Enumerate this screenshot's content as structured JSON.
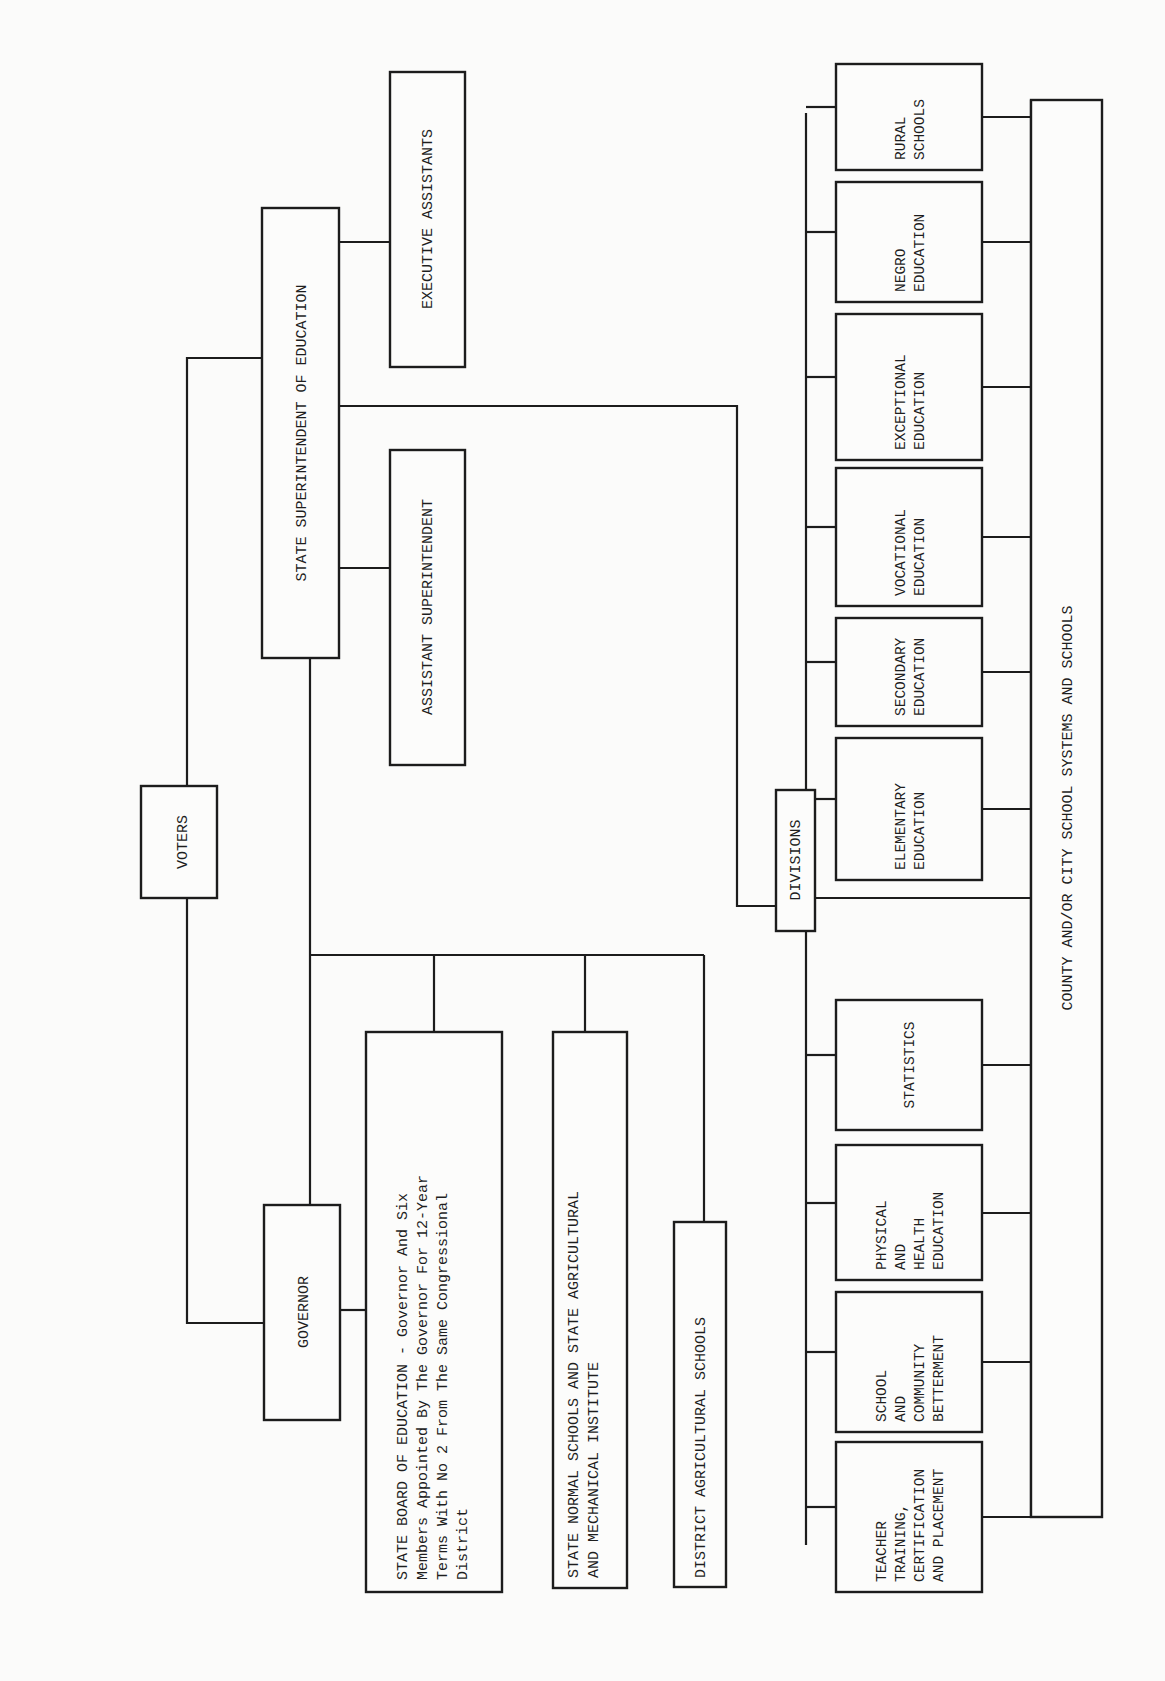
{
  "diagram": {
    "orientation": "rotated-90-ccw",
    "nodes": {
      "voters": {
        "label": "VOTERS"
      },
      "governor": {
        "label": "GOVERNOR"
      },
      "state_superintendent": {
        "label": "STATE SUPERINTENDENT OF EDUCATION"
      },
      "executive_assistants": {
        "label": "EXECUTIVE ASSISTANTS"
      },
      "assistant_superintendent": {
        "label": "ASSISTANT SUPERINTENDENT"
      },
      "state_board": {
        "lines": [
          "STATE BOARD OF EDUCATION - Governor And Six",
          "Members Appointed By The Governor For 12-Year",
          "Terms With No 2 From The Same Congressional",
          "District"
        ]
      },
      "normal_schools": {
        "lines": [
          "STATE NORMAL SCHOOLS AND STATE AGRICULTURAL",
          "AND MECHANICAL INSTITUTE"
        ]
      },
      "district_agricultural": {
        "label": "DISTRICT AGRICULTURAL SCHOOLS"
      },
      "divisions": {
        "label": "DIVISIONS"
      },
      "county_city": {
        "label": "COUNTY AND/OR CITY SCHOOL SYSTEMS AND SCHOOLS"
      }
    },
    "divisions": [
      {
        "lines": [
          "RURAL",
          "SCHOOLS"
        ]
      },
      {
        "lines": [
          "NEGRO",
          "EDUCATION"
        ]
      },
      {
        "lines": [
          "EXCEPTIONAL",
          "EDUCATION"
        ]
      },
      {
        "lines": [
          "VOCATIONAL",
          "EDUCATION"
        ]
      },
      {
        "lines": [
          "SECONDARY",
          "EDUCATION"
        ]
      },
      {
        "lines": [
          "ELEMENTARY",
          "EDUCATION"
        ]
      },
      {
        "lines": [
          "STATISTICS"
        ]
      },
      {
        "lines": [
          "PHYSICAL",
          "AND",
          "HEALTH",
          "EDUCATION"
        ]
      },
      {
        "lines": [
          "SCHOOL",
          "AND",
          "COMMUNITY",
          "BETTERMENT"
        ]
      },
      {
        "lines": [
          "TEACHER",
          "TRAINING,",
          "CERTIFICATION",
          "AND PLACEMENT"
        ]
      }
    ]
  }
}
